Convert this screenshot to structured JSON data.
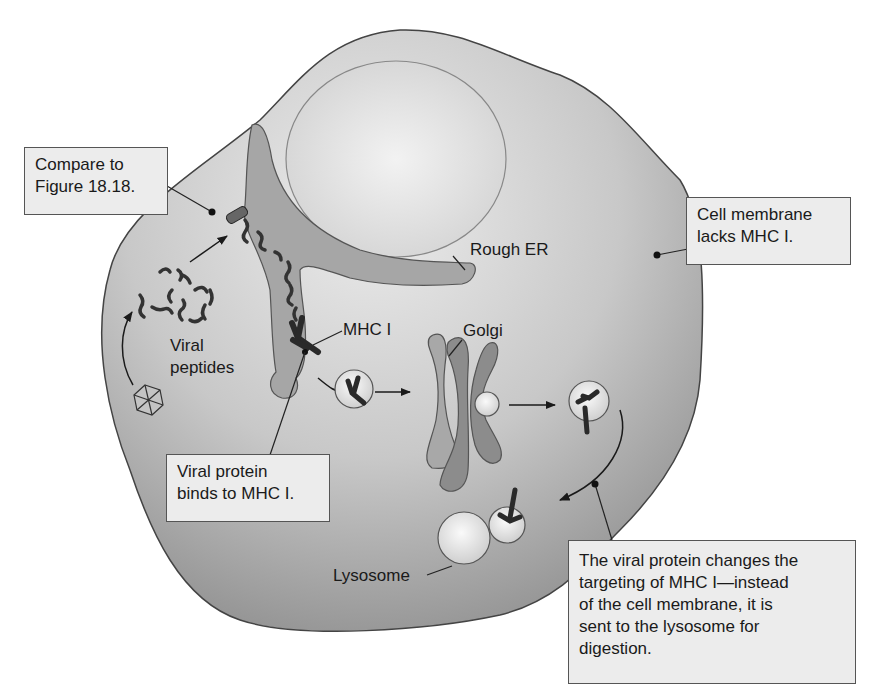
{
  "figure": {
    "labels": {
      "rough_er": "Rough ER",
      "mhc_i": "MHC I",
      "golgi": "Golgi",
      "viral_peptides": [
        "Viral",
        "peptides"
      ],
      "lysosome": "Lysosome"
    },
    "callouts": {
      "compare": [
        "Compare to",
        "Figure 18.18."
      ],
      "membrane": [
        "Cell membrane",
        "lacks MHC I."
      ],
      "binds": [
        "Viral protein",
        "binds to MHC I."
      ],
      "targeting": [
        "The viral protein changes the",
        "targeting of MHC I—instead",
        "of the cell membrane, it is",
        "sent to the lysosome for",
        "digestion."
      ]
    },
    "colors": {
      "cytoplasm_light": "#e6e6e6",
      "cytoplasm_dark": "#9a9a9a",
      "nucleus": "#dcdcdc",
      "er": "#a8a8a8",
      "golgi": "#8f8f8f",
      "vesicle": "#f0f0f0",
      "protein": "#333333",
      "callout_bg": "#ececec",
      "outline": "#444444"
    }
  }
}
